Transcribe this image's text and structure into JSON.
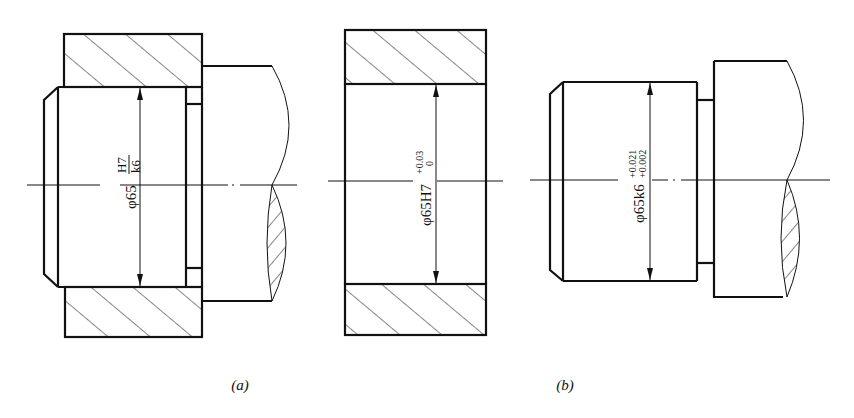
{
  "figure": {
    "panels": [
      {
        "id": "a",
        "caption": "(a)",
        "description": "Hole-shaft assembly fit",
        "dimension": {
          "prefix": "φ65",
          "fit_numerator": "H7",
          "fit_denominator": "k6"
        }
      },
      {
        "id": "b",
        "caption": "(b)",
        "description": "Separate hole and shaft tolerance callouts",
        "hole_dimension": {
          "prefix": "φ65H7",
          "upper_deviation": "+0.03",
          "lower_deviation": "0"
        },
        "shaft_dimension": {
          "prefix": "φ65k6",
          "upper_deviation": "+0.021",
          "lower_deviation": "+0.002"
        }
      }
    ],
    "colors": {
      "line": "#111111",
      "background": "#ffffff"
    }
  }
}
